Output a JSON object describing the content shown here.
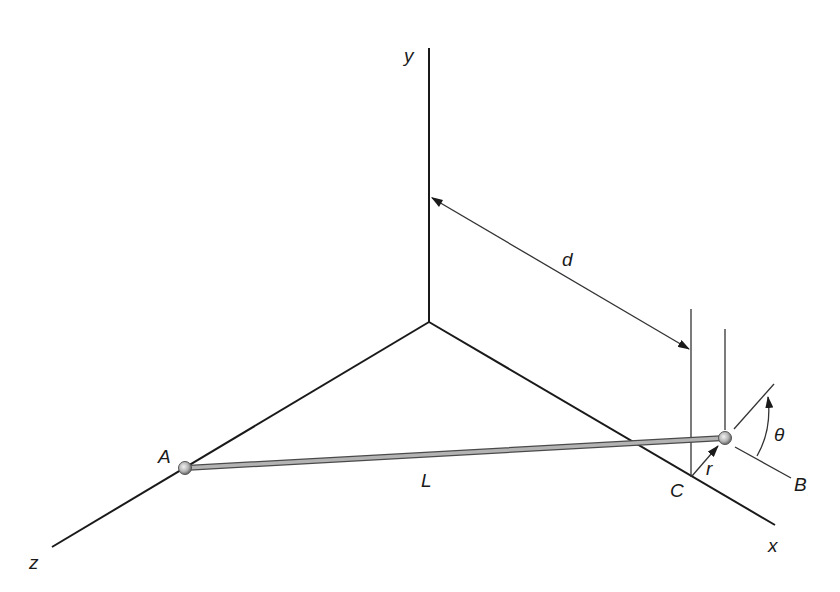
{
  "diagram": {
    "type": "3d-axes-mechanics",
    "labels": {
      "y_axis": "y",
      "x_axis": "x",
      "z_axis": "z",
      "point_a": "A",
      "point_b": "B",
      "point_c": "C",
      "length": "L",
      "distance": "d",
      "radius": "r",
      "angle": "θ"
    },
    "colors": {
      "axis": "#1a1a1a",
      "rod_fill": "#a8a8a8",
      "rod_edge": "#4a4a4a",
      "ball": "#b0b0b0",
      "thin_line": "#333333"
    }
  }
}
